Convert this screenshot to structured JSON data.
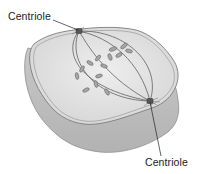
{
  "diagram": {
    "labels": [
      {
        "id": "top",
        "text": "Centriole",
        "points_to": "upper centriole"
      },
      {
        "id": "bottom",
        "text": "Centriole",
        "points_to": "lower centriole"
      }
    ],
    "colors": {
      "cell_fill": "#d2d2d2",
      "cell_side": "#bdbdbd",
      "cell_top": "#e4e4e4",
      "membrane_line": "#8a8a8a",
      "spindle_fiber": "#6e6e6e",
      "chromosome": "#a6a6a6",
      "chromosome_outline": "#6a6a6a",
      "centriole": "#555555",
      "leader_line": "#222222",
      "text": "#1a1a1a"
    }
  }
}
